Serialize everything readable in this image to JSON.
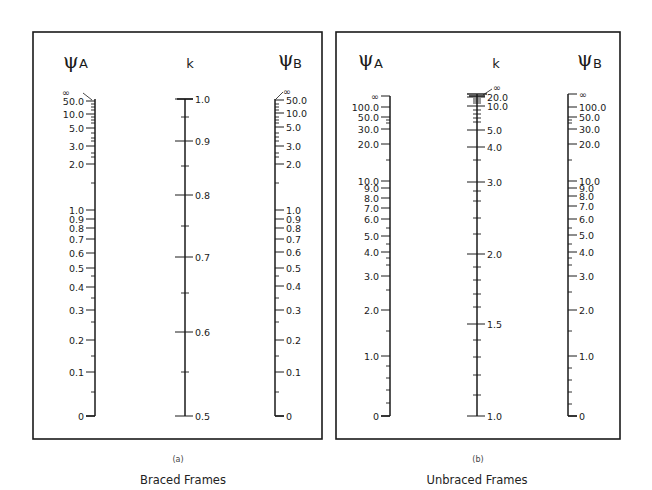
{
  "chart_data": [
    {
      "type": "nomograph",
      "id": "a",
      "subtitle": "(a)",
      "title": "Braced Frames",
      "axes": [
        {
          "name": "psi_A",
          "symbol": "ψ",
          "subscript": "A",
          "labels": [
            "∞",
            "50.0",
            "10.0",
            "5.0",
            "3.0",
            "2.0",
            "1.0",
            "0.9",
            "0.8",
            "0.7",
            "0.6",
            "0.5",
            "0.4",
            "0.3",
            "0.2",
            "0.1",
            "0"
          ]
        },
        {
          "name": "k",
          "symbol": "k",
          "labels": [
            "1.0",
            "0.9",
            "0.8",
            "0.7",
            "0.6",
            "0.5"
          ],
          "range": [
            0.5,
            1.0
          ]
        },
        {
          "name": "psi_B",
          "symbol": "ψ",
          "subscript": "B",
          "labels": [
            "∞",
            "50.0",
            "10.0",
            "5.0",
            "3.0",
            "2.0",
            "1.0",
            "0.9",
            "0.8",
            "0.7",
            "0.6",
            "0.5",
            "0.4",
            "0.3",
            "0.2",
            "0.1",
            "0"
          ]
        }
      ]
    },
    {
      "type": "nomograph",
      "id": "b",
      "subtitle": "(b)",
      "title": "Unbraced Frames",
      "axes": [
        {
          "name": "psi_A",
          "symbol": "ψ",
          "subscript": "A",
          "labels": [
            "∞",
            "100.0",
            "50.0",
            "30.0",
            "20.0",
            "10.0",
            "9.0",
            "8.0",
            "7.0",
            "6.0",
            "5.0",
            "4.0",
            "3.0",
            "2.0",
            "1.0",
            "0"
          ]
        },
        {
          "name": "k",
          "symbol": "k",
          "labels": [
            "∞",
            "20.0",
            "10.0",
            "5.0",
            "4.0",
            "3.0",
            "2.0",
            "1.5",
            "1.0"
          ],
          "range": [
            1.0,
            "∞"
          ]
        },
        {
          "name": "psi_B",
          "symbol": "ψ",
          "subscript": "B",
          "labels": [
            "∞",
            "100.0",
            "50.0",
            "30.0",
            "20.0",
            "10.0",
            "9.0",
            "8.0",
            "7.0",
            "6.0",
            "5.0",
            "4.0",
            "3.0",
            "2.0",
            "1.0",
            "0"
          ]
        }
      ]
    }
  ],
  "panels": {
    "a": {
      "psiA": {
        "sym": "ψ",
        "sub": "A"
      },
      "k": "k",
      "psiB": {
        "sym": "ψ",
        "sub": "B"
      },
      "ticksA": [
        {
          "v": "50.0",
          "y": 101
        },
        {
          "v": "10.0",
          "y": 114
        },
        {
          "v": "5.0",
          "y": 128
        },
        {
          "v": "3.0",
          "y": 146
        },
        {
          "v": "2.0",
          "y": 164
        },
        {
          "v": "1.0",
          "y": 210
        },
        {
          "v": "0.9",
          "y": 219
        },
        {
          "v": "0.8",
          "y": 228
        },
        {
          "v": "0.7",
          "y": 239
        },
        {
          "v": "0.6",
          "y": 253
        },
        {
          "v": "0.5",
          "y": 268
        },
        {
          "v": "0.4",
          "y": 287
        },
        {
          "v": "0.3",
          "y": 310
        },
        {
          "v": "0.2",
          "y": 340
        },
        {
          "v": "0.1",
          "y": 372
        },
        {
          "v": "0",
          "y": 416
        }
      ],
      "minorA": [
        104,
        107,
        110,
        117,
        120,
        123,
        133,
        138,
        141,
        153,
        157,
        183,
        276,
        298,
        322,
        356,
        392
      ],
      "ticksK": [
        {
          "v": "1.0",
          "y": 99
        },
        {
          "v": "0.9",
          "y": 141
        },
        {
          "v": "0.8",
          "y": 195
        },
        {
          "v": "0.7",
          "y": 257
        },
        {
          "v": "0.6",
          "y": 332
        },
        {
          "v": "0.5",
          "y": 416
        }
      ],
      "minorK": [
        117,
        166,
        226,
        293,
        372
      ],
      "ticksB": [
        {
          "v": "50.0",
          "y": 100
        },
        {
          "v": "10.0",
          "y": 113
        },
        {
          "v": "5.0",
          "y": 127
        },
        {
          "v": "3.0",
          "y": 146
        },
        {
          "v": "2.0",
          "y": 164
        },
        {
          "v": "1.0",
          "y": 210
        },
        {
          "v": "0.9",
          "y": 219
        },
        {
          "v": "0.8",
          "y": 228
        },
        {
          "v": "0.7",
          "y": 239
        },
        {
          "v": "0.6",
          "y": 252
        },
        {
          "v": "0.5",
          "y": 268
        },
        {
          "v": "0.4",
          "y": 286
        },
        {
          "v": "0.3",
          "y": 310
        },
        {
          "v": "0.2",
          "y": 340
        },
        {
          "v": "0.1",
          "y": 372
        },
        {
          "v": "0",
          "y": 416
        }
      ],
      "minorB": [
        104,
        107,
        110,
        117,
        120,
        123,
        133,
        137,
        141,
        153,
        157,
        183,
        276,
        298,
        322,
        356,
        392
      ],
      "inf_label": "∞",
      "subtitle": "(a)",
      "caption": "Braced Frames"
    },
    "b": {
      "psiA": {
        "sym": "ψ",
        "sub": "A"
      },
      "k": "k",
      "psiB": {
        "sym": "ψ",
        "sub": "B"
      },
      "ticksA": [
        {
          "v": "∞",
          "y": 96
        },
        {
          "v": "100.0",
          "y": 107
        },
        {
          "v": "50.0",
          "y": 117
        },
        {
          "v": "30.0",
          "y": 129
        },
        {
          "v": "20.0",
          "y": 144
        },
        {
          "v": "10.0",
          "y": 181
        },
        {
          "v": "9.0",
          "y": 188
        },
        {
          "v": "8.0",
          "y": 198
        },
        {
          "v": "7.0",
          "y": 208
        },
        {
          "v": "6.0",
          "y": 219
        },
        {
          "v": "5.0",
          "y": 236
        },
        {
          "v": "4.0",
          "y": 252
        },
        {
          "v": "3.0",
          "y": 276
        },
        {
          "v": "2.0",
          "y": 310
        },
        {
          "v": "1.0",
          "y": 356
        },
        {
          "v": "0",
          "y": 416
        }
      ],
      "minorA": [
        120,
        123,
        160,
        228,
        244,
        258,
        265,
        290,
        331,
        366,
        378,
        390,
        403
      ],
      "ticksK": [
        {
          "v": "∞",
          "y": 94
        },
        {
          "v": "20.0",
          "y": 97
        },
        {
          "v": "10.0",
          "y": 106
        },
        {
          "v": "5.0",
          "y": 130
        },
        {
          "v": "4.0",
          "y": 147
        },
        {
          "v": "3.0",
          "y": 182
        },
        {
          "v": "2.0",
          "y": 254
        },
        {
          "v": "1.5",
          "y": 324
        },
        {
          "v": "1.0",
          "y": 416
        }
      ],
      "minorK": [
        99,
        101,
        103,
        110,
        114,
        118,
        122,
        160,
        191,
        201,
        218,
        234,
        267,
        280,
        294,
        307,
        340,
        357,
        375,
        395
      ],
      "ticksB": [
        {
          "v": "∞",
          "y": 94
        },
        {
          "v": "100.0",
          "y": 107
        },
        {
          "v": "50.0",
          "y": 117
        },
        {
          "v": "30.0",
          "y": 129
        },
        {
          "v": "20.0",
          "y": 144
        },
        {
          "v": "10.0",
          "y": 181
        },
        {
          "v": "9.0",
          "y": 188
        },
        {
          "v": "8.0",
          "y": 196
        },
        {
          "v": "7.0",
          "y": 206
        },
        {
          "v": "6.0",
          "y": 219
        },
        {
          "v": "5.0",
          "y": 235
        },
        {
          "v": "4.0",
          "y": 252
        },
        {
          "v": "3.0",
          "y": 276
        },
        {
          "v": "2.0",
          "y": 310
        },
        {
          "v": "1.0",
          "y": 356
        },
        {
          "v": "0",
          "y": 416
        }
      ],
      "minorB": [
        120,
        123,
        160,
        228,
        244,
        258,
        265,
        292,
        331,
        368,
        380,
        392,
        404
      ],
      "subtitle": "(b)",
      "caption": "Unbraced Frames"
    }
  }
}
